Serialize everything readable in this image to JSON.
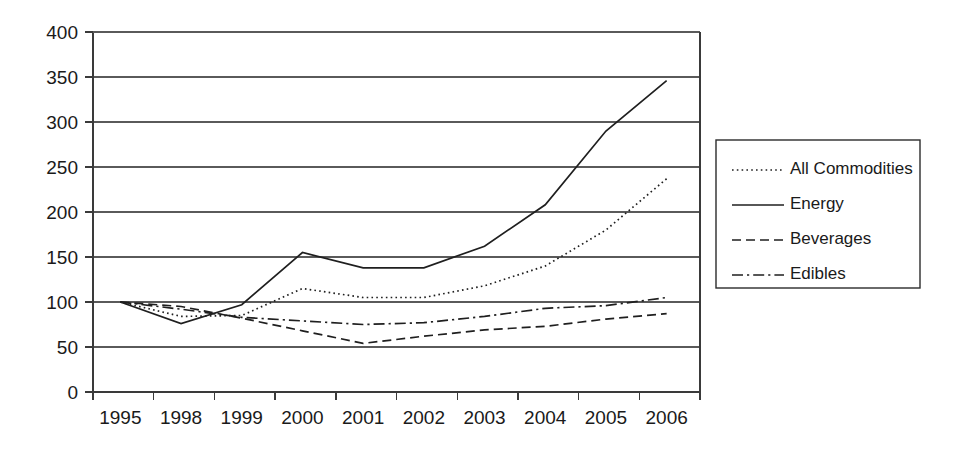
{
  "chart_data": {
    "type": "line",
    "title": "",
    "xlabel": "",
    "ylabel": "",
    "categories": [
      "1995",
      "1998",
      "1999",
      "2000",
      "2001",
      "2002",
      "2003",
      "2004",
      "2005",
      "2006"
    ],
    "ylim": [
      0,
      400
    ],
    "yticks": [
      0,
      50,
      100,
      150,
      200,
      250,
      300,
      350,
      400
    ],
    "ytick_labels": [
      "0",
      "50",
      "100",
      "150",
      "200",
      "250",
      "300",
      "350",
      "400"
    ],
    "grid": true,
    "legend_position": "right",
    "series": [
      {
        "name": "All Commodities",
        "line_style": "dotted",
        "values": [
          100,
          84,
          85,
          115,
          105,
          105,
          118,
          140,
          180,
          237
        ]
      },
      {
        "name": "Energy",
        "line_style": "solid",
        "values": [
          100,
          76,
          97,
          155,
          138,
          138,
          162,
          208,
          290,
          346
        ]
      },
      {
        "name": "Beverages",
        "line_style": "dashed",
        "values": [
          100,
          95,
          82,
          68,
          54,
          62,
          69,
          73,
          81,
          87
        ]
      },
      {
        "name": "Edibles",
        "line_style": "dashdot",
        "values": [
          100,
          92,
          83,
          79,
          75,
          77,
          84,
          93,
          96,
          105
        ]
      }
    ]
  },
  "legend": {
    "items": [
      {
        "label": "All Commodities"
      },
      {
        "label": "Energy"
      },
      {
        "label": "Beverages"
      },
      {
        "label": "Edibles"
      }
    ]
  },
  "colors": {
    "line": "#1f1f1f",
    "grid": "#5a5a5a",
    "axis": "#3a3a3a",
    "background": "#ffffff",
    "text": "#1a1a1a"
  }
}
